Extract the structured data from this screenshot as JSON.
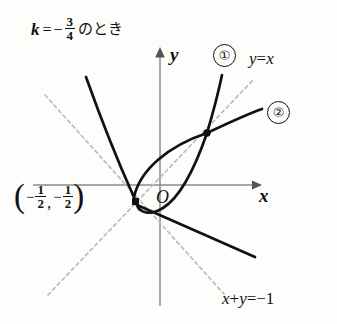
{
  "figure": {
    "kind": "math-graph",
    "background_color": "#fdfdfb",
    "ink_color": "#111111",
    "dashed_color": "#b9b9b9",
    "axis_color": "#8a8a8a",
    "condition": {
      "variable": "k",
      "equals": "=",
      "minus": "−",
      "numerator": "3",
      "denominator": "4",
      "japanese_suffix": "のとき",
      "full_text": "k = −3/4 のとき"
    },
    "axes": {
      "x_label": "x",
      "y_label": "y",
      "origin_label": "O",
      "x_axis_y_px": 185,
      "y_axis_x_px": 160,
      "x_axis_from_px": 33,
      "x_axis_to_px": 258,
      "y_axis_from_px": 53,
      "y_axis_to_px": 306
    },
    "branch_labels": [
      {
        "name": "branch-1",
        "text": "①"
      },
      {
        "name": "branch-2",
        "text": "②"
      }
    ],
    "dashed_lines": [
      {
        "name": "line-y-equals-x",
        "lhs": "y",
        "op": "=",
        "rhs": "x",
        "text": "y=x",
        "from": [
          48,
          295
        ],
        "to": [
          253,
          80
        ]
      },
      {
        "name": "line-x-plus-y",
        "text": "x+y=−1",
        "lhs": "x",
        "op1": "+",
        "mid": "y",
        "op2": "=",
        "rhs": "−1",
        "from": [
          45,
          95
        ],
        "to": [
          222,
          292
        ]
      }
    ],
    "marked_points": [
      {
        "name": "tangency-point",
        "label": "(−1/2, −1/2)",
        "marker": "square",
        "px": [
          136,
          202
        ],
        "coord_parts": {
          "open": "(",
          "minus1": "−",
          "num1": "1",
          "den1": "2",
          "comma": ",",
          "minus2": "−",
          "num2": "1",
          "den2": "2",
          "close": ")"
        }
      },
      {
        "name": "self-intersection-point",
        "marker": "dot",
        "px": [
          207,
          133
        ]
      }
    ],
    "curve": {
      "name": "loop-curve",
      "description": "parabola-like curve with teardrop loop, cusp-like tangency at (-1/2,-1/2) and node on y=x",
      "stroke_width": 2.6,
      "upper_left_end": [
        86,
        77
      ],
      "upper_right_end": [
        222,
        75
      ],
      "branch2_right_end": [
        262,
        109
      ],
      "lower_right_end": [
        255,
        257
      ]
    }
  }
}
